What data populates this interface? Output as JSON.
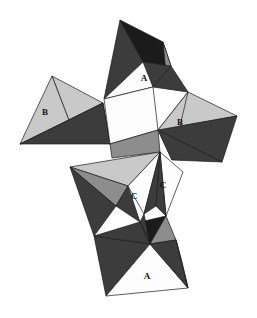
{
  "figure": {
    "width": 257,
    "height": 318,
    "background": "#ffffff",
    "edge_color": "#1a1a1a",
    "edge_width": 0.7,
    "palette": {
      "white": "#fdfdfd",
      "light_gray": "#c9c9c9",
      "mid_gray": "#8d8d8d",
      "dark_gray": "#3c3c3c",
      "near_black": "#1b1b1b",
      "shadow_gray": "#5a5a5a"
    },
    "faces": [
      {
        "name": "top-spike-left-dark",
        "tone": "dark_gray",
        "points": "120,20 104,99 143,62"
      },
      {
        "name": "top-spike-black-right",
        "tone": "near_black",
        "points": "120,20 143,62 163,42"
      },
      {
        "name": "top-spike-black-core",
        "tone": "near_black",
        "points": "143,62 163,42 171,66"
      },
      {
        "name": "top-spike-mid-sliver",
        "tone": "mid_gray",
        "points": "163,42 171,66 166,73"
      },
      {
        "name": "top-spike-dark-fold",
        "tone": "dark_gray",
        "points": "143,62 171,66 153,87"
      },
      {
        "name": "top-face-A-white",
        "tone": "white",
        "points": "104,99 143,62 153,87"
      },
      {
        "name": "top-right-dark-edge",
        "tone": "dark_gray",
        "points": "153,87 171,66 188,92"
      },
      {
        "name": "left-wing-light-upper",
        "tone": "light_gray",
        "points": "52,76 103,103 70,123"
      },
      {
        "name": "left-wing-B-white-face",
        "tone": "light_gray",
        "points": "52,76 70,123 20,144"
      },
      {
        "name": "left-wing-dark-lower",
        "tone": "dark_gray",
        "points": "20,144 70,123 103,103"
      },
      {
        "name": "left-wing-dark-inner",
        "tone": "dark_gray",
        "points": "70,123 103,103 110,144"
      },
      {
        "name": "left-wing-dark-tail",
        "tone": "dark_gray",
        "points": "20,144 103,103 110,144"
      },
      {
        "name": "center-white-quad",
        "tone": "white",
        "points": "104,99 153,87 158,130 110,144"
      },
      {
        "name": "right-wing-light-upper",
        "tone": "light_gray",
        "points": "188,92 237,116 158,130"
      },
      {
        "name": "right-wing-B-light",
        "tone": "light_gray",
        "points": "188,92 158,130 172,160"
      },
      {
        "name": "right-wing-dark-lower",
        "tone": "dark_gray",
        "points": "158,130 237,116 222,162"
      },
      {
        "name": "right-wing-dark-inner",
        "tone": "dark_gray",
        "points": "158,130 222,162 172,160"
      },
      {
        "name": "mid-band-mid-gray",
        "tone": "mid_gray",
        "points": "110,144 158,130 160,152 112,158"
      },
      {
        "name": "lower-left-light-fan",
        "tone": "light_gray",
        "points": "70,167 160,152 128,186"
      },
      {
        "name": "lower-left-mid-fan",
        "tone": "mid_gray",
        "points": "70,167 128,186 116,206"
      },
      {
        "name": "lower-left-dark-fan",
        "tone": "dark_gray",
        "points": "70,167 116,206 94,236"
      },
      {
        "name": "lower-left-dark-fold",
        "tone": "dark_gray",
        "points": "116,206 128,186 140,222"
      },
      {
        "name": "C-left-white",
        "tone": "white",
        "points": "128,186 160,152 144,214"
      },
      {
        "name": "C-wedge-dark",
        "tone": "dark_gray",
        "points": "160,152 144,214 156,206"
      },
      {
        "name": "C-right-white",
        "tone": "white",
        "points": "160,152 183,172 166,216"
      },
      {
        "name": "C-right-dark-edge",
        "tone": "dark_gray",
        "points": "160,152 166,216 156,206"
      },
      {
        "name": "bottom-knot-black",
        "tone": "near_black",
        "points": "140,222 166,216 150,244"
      },
      {
        "name": "bottom-knot-dark",
        "tone": "dark_gray",
        "points": "144,214 140,222 150,244"
      },
      {
        "name": "bottom-knot-mid",
        "tone": "mid_gray",
        "points": "166,216 150,244 176,240"
      },
      {
        "name": "bottom-left-dark-blade",
        "tone": "dark_gray",
        "points": "94,236 150,244 106,296"
      },
      {
        "name": "bottom-left-dark-blade-2",
        "tone": "dark_gray",
        "points": "94,236 140,222 150,244"
      },
      {
        "name": "bottom-A-white",
        "tone": "white",
        "points": "106,296 150,244 188,288"
      },
      {
        "name": "bottom-right-dark",
        "tone": "dark_gray",
        "points": "150,244 176,240 188,288"
      },
      {
        "name": "bottom-right-mid",
        "tone": "mid_gray",
        "points": "176,240 188,288 182,262"
      }
    ],
    "labels": [
      {
        "name": "face-label-a-top",
        "text": "A",
        "x": 144,
        "y": 79
      },
      {
        "name": "face-label-b-left",
        "text": "B",
        "x": 45,
        "y": 113
      },
      {
        "name": "face-label-b-right",
        "text": "B",
        "x": 180,
        "y": 123
      },
      {
        "name": "face-label-c-left",
        "text": "C",
        "x": 134,
        "y": 197
      },
      {
        "name": "face-label-c-right",
        "text": "C",
        "x": 163,
        "y": 186
      },
      {
        "name": "face-label-a-bottom",
        "text": "A",
        "x": 147,
        "y": 277
      }
    ]
  }
}
